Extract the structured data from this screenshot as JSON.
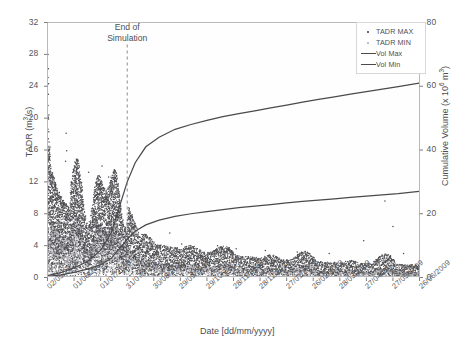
{
  "chart_data": {
    "type": "line",
    "title": "",
    "xlabel": "Date [dd/mm/yyyy]",
    "ylabel": "TADR (m3/s)",
    "y2label": "Cumulative Volume (x 106 m3)",
    "ylim": [
      0,
      32
    ],
    "y2lim": [
      0,
      80
    ],
    "yticks": [
      0,
      4,
      8,
      12,
      16,
      20,
      24,
      28,
      32
    ],
    "y2ticks": [
      0,
      20,
      40,
      60,
      80
    ],
    "grid": false,
    "legend_position": "top-right",
    "categories": [
      "02/05/2008",
      "01/06/2008",
      "01/07/2008",
      "31/07/2008",
      "30/08/2008",
      "29/09/2008",
      "29/10/2008",
      "28/11/2008",
      "28/12/2008",
      "27/01/2009",
      "26/02/2009",
      "28/03/2009",
      "27/04/2009",
      "27/05/2009",
      "26/06/2009"
    ],
    "annotations": [
      {
        "text_line1": "End of",
        "text_line2": "Simulation",
        "x_value": "31/07/2008"
      }
    ],
    "series": [
      {
        "name": "Vol Max",
        "type": "line",
        "axis": "y2",
        "color": "#4a4a4e",
        "x": [
          0,
          0.5,
          1.0,
          1.5,
          2.0,
          2.4,
          2.7,
          3.0,
          3.3,
          3.7,
          4.2,
          4.8,
          5.4,
          6.0,
          6.6,
          7.2,
          7.8,
          8.4,
          9.0,
          9.6,
          10.2,
          10.8,
          11.4,
          12.0,
          12.6,
          13.2,
          14.0
        ],
        "values": [
          0.6,
          1.5,
          3.0,
          5.0,
          8.5,
          14.0,
          22.0,
          30.0,
          36.0,
          41.0,
          44.0,
          46.5,
          48.0,
          49.3,
          50.5,
          51.4,
          52.3,
          53.2,
          54.1,
          55.0,
          55.9,
          56.7,
          57.5,
          58.3,
          59.1,
          59.9,
          61.0
        ]
      },
      {
        "name": "Vol Min",
        "type": "line",
        "axis": "y2",
        "color": "#4a4a4e",
        "x": [
          0,
          0.5,
          1.0,
          1.5,
          2.0,
          2.4,
          2.7,
          3.0,
          3.3,
          3.7,
          4.2,
          4.8,
          5.4,
          6.0,
          6.6,
          7.2,
          7.8,
          8.4,
          9.0,
          9.6,
          10.2,
          10.8,
          11.4,
          12.0,
          12.6,
          13.2,
          14.0
        ],
        "values": [
          0.3,
          0.8,
          1.6,
          2.6,
          4.0,
          6.0,
          9.0,
          12.0,
          14.5,
          16.5,
          18.0,
          19.2,
          20.0,
          20.7,
          21.3,
          21.9,
          22.4,
          22.9,
          23.4,
          23.9,
          24.3,
          24.7,
          25.1,
          25.5,
          25.9,
          26.3,
          27.0
        ]
      },
      {
        "name": "TADR MAX",
        "type": "scatter",
        "axis": "y1",
        "color": "#4c4c50",
        "description": "Dark scatter cloud of maximum time-averaged discharge rate; high outliers to 28 m3/s near 02/05/2008, dense peaks 10-16 m3/s through 01/06/2008-31/07/2008, declining to 1-5 m3/s after end of simulation."
      },
      {
        "name": "TADR MIN",
        "type": "scatter",
        "axis": "y1",
        "color": "#a9a9ae",
        "description": "Light grey scatter cloud of minimum time-averaged discharge rate, lying below the MAX cloud, mostly 0-8 m3/s."
      }
    ]
  },
  "legend": {
    "items": [
      {
        "label": "TADR MAX",
        "marker": "dot-dark"
      },
      {
        "label": "TADR MIN",
        "marker": "dot-light"
      },
      {
        "label": "Vol Max",
        "marker": "line"
      },
      {
        "label": "Vol Min",
        "marker": "line"
      }
    ]
  },
  "axes": {
    "y_title_main": "TADR (m",
    "y_title_sup": "3",
    "y_title_tail": "/s)",
    "y2_title_main": "Cumulative Volume (x 10",
    "y2_title_sup": "6",
    "y2_title_tail": " m",
    "y2_title_sup2": "3",
    "y2_title_tail2": ")",
    "x_title": "Date [dd/mm/yyyy]"
  },
  "colors": {
    "line": "#4a4a4e",
    "scatter_max": "#4c4c50",
    "scatter_min": "#a9a9ae",
    "frame": "#b9b9bd",
    "text": "#56565a"
  }
}
